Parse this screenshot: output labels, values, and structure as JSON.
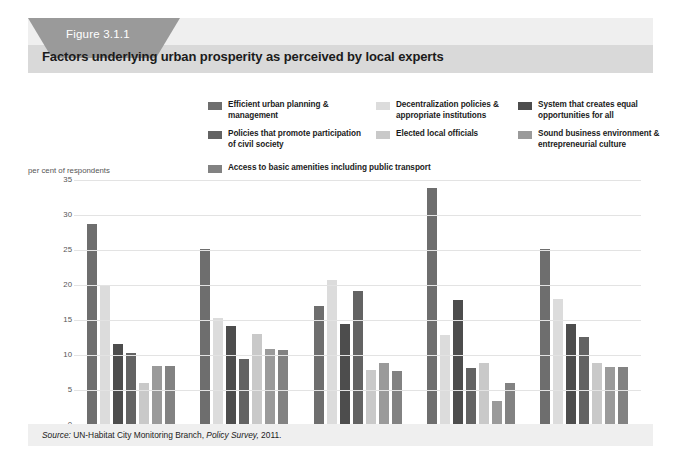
{
  "figure": {
    "tag_label": "Figure 3.1.1",
    "title": "Factors underlying urban prosperity as perceived by local experts",
    "source_prefix": "Source:",
    "source_text": "UN-Habitat City Monitoring Branch,",
    "source_italic": "Policy Survey,",
    "source_year": "2011."
  },
  "colors": {
    "panel_background": "#ffffff",
    "card_background": "#efefef",
    "header_band": "#d9d9d9",
    "tab": "#9a9a9a",
    "gridline": "#e3e3e3",
    "axis": "#9b9b9b",
    "text": "#1b1b1b"
  },
  "chart_data": {
    "type": "bar",
    "title": "Factors underlying urban prosperity as perceived by local experts",
    "xlabel": "",
    "ylabel": "per cent of respondents",
    "ylim": [
      0,
      35
    ],
    "yticks": [
      0,
      5,
      10,
      15,
      20,
      25,
      30,
      35
    ],
    "grid": true,
    "legend_position": "top",
    "categories": [
      "Africa",
      "Asia",
      "LAC",
      "Arab States",
      "All regions"
    ],
    "series": [
      {
        "name": "Efficient urban planning & management",
        "color": "#6e6e6e",
        "values": [
          28.7,
          25.2,
          17.0,
          33.8,
          25.1
        ]
      },
      {
        "name": "Decentralization policies & appropriate institutions",
        "color": "#dcdcdc",
        "values": [
          19.8,
          15.3,
          20.7,
          12.9,
          18.0
        ]
      },
      {
        "name": "System that creates equal opportunities for all",
        "color": "#4d4d4d",
        "values": [
          11.6,
          14.1,
          14.4,
          17.8,
          14.4
        ]
      },
      {
        "name": "Policies that promote participation of civil society",
        "color": "#636363",
        "values": [
          10.3,
          9.5,
          19.2,
          8.2,
          12.6
        ]
      },
      {
        "name": "Elected local officials",
        "color": "#c9c9c9",
        "values": [
          6.0,
          13.0,
          7.8,
          8.9,
          8.9
        ]
      },
      {
        "name": "Sound business environment & entrepreneurial culture",
        "color": "#9a9a9a",
        "values": [
          8.4,
          10.8,
          8.9,
          3.5,
          8.3
        ]
      },
      {
        "name": "Access to basic amenities including public transport",
        "color": "#828282",
        "values": [
          8.4,
          10.7,
          7.7,
          6.0,
          8.3
        ]
      }
    ]
  },
  "legend": {
    "col1": [
      {
        "label": "Efficient urban planning & management",
        "color": "#6e6e6e"
      },
      {
        "label": "Policies that promote participation of civil society",
        "color": "#636363"
      }
    ],
    "col2": [
      {
        "label": "Decentralization policies & appropriate institutions",
        "color": "#dcdcdc"
      },
      {
        "label": "Elected local officials",
        "color": "#c9c9c9"
      }
    ],
    "col3": [
      {
        "label": "System that creates equal opportunities for all",
        "color": "#4d4d4d"
      },
      {
        "label": "Sound business environment & entrepreneurial culture",
        "color": "#9a9a9a"
      }
    ],
    "wide": {
      "label": "Access to basic amenities including public transport",
      "color": "#828282"
    }
  }
}
